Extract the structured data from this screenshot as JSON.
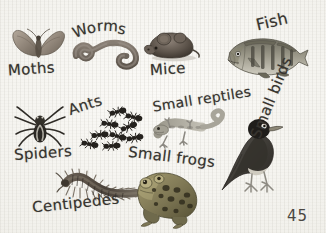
{
  "page": {
    "page_number": "45",
    "background_color": "#f2f1ec",
    "ink_color": "#37342f",
    "style": "handwritten labels over watercolor-style natural history illustrations on lightly textured paper"
  },
  "labels": {
    "moths": "Moths",
    "worms": "Worms",
    "mice": "Mice",
    "fish": "Fish",
    "spiders": "Spiders",
    "ants": "Ants",
    "small_reptiles": "Small reptiles",
    "small_frogs": "Small frogs",
    "centipedes": "Centipedes",
    "small_birds": "Small birds"
  },
  "items": [
    {
      "key": "moths",
      "label": "Moths",
      "icon": "moth-illustration",
      "color": "#8b8278",
      "row": 1,
      "col": 1
    },
    {
      "key": "worms",
      "label": "Worms",
      "icon": "worm-illustration",
      "color": "#6e655c",
      "row": 1,
      "col": 2
    },
    {
      "key": "mice",
      "label": "Mice",
      "icon": "mouse-illustration",
      "color": "#6b6057",
      "row": 1,
      "col": 3
    },
    {
      "key": "fish",
      "label": "Fish",
      "icon": "perch-fish-illustration",
      "color": "#7c7a6e",
      "row": 1,
      "col": 4
    },
    {
      "key": "spiders",
      "label": "Spiders",
      "icon": "spider-illustration",
      "color": "#3c3934",
      "row": 2,
      "col": 1
    },
    {
      "key": "ants",
      "label": "Ants",
      "icon": "ants-illustration",
      "color": "#2e2b27",
      "row": 2,
      "col": 2
    },
    {
      "key": "small_reptiles",
      "label": "Small reptiles",
      "icon": "lizard-illustration",
      "color": "#8d8b80",
      "row": 2,
      "col": 3
    },
    {
      "key": "small_birds",
      "label": "Small birds",
      "icon": "bird-illustration",
      "color": "#4a4742",
      "row": 2,
      "col": 4
    },
    {
      "key": "centipedes",
      "label": "Centipedes",
      "icon": "centipede-illustration",
      "color": "#4e463d",
      "row": 3,
      "col": 1
    },
    {
      "key": "small_frogs",
      "label": "Small frogs",
      "icon": "frog-illustration",
      "color": "#6f6a52",
      "row": 3,
      "col": 3
    }
  ],
  "ants_count": 9
}
